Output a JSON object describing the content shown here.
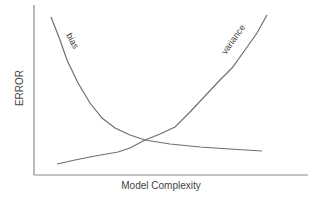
{
  "chart_data": {
    "type": "line",
    "title": "",
    "xlabel": "Model Complexity",
    "ylabel": "ERROR",
    "grid": false,
    "legend": "none (inline curve labels)",
    "series": [
      {
        "name": "bias",
        "label": "bias",
        "description": "decreasing with model complexity",
        "points_px": [
          [
            51,
            17
          ],
          [
            60,
            40
          ],
          [
            67,
            60
          ],
          [
            78,
            83
          ],
          [
            90,
            103
          ],
          [
            102,
            118
          ],
          [
            115,
            128
          ],
          [
            130,
            135
          ],
          [
            145,
            140
          ],
          [
            170,
            144
          ],
          [
            200,
            147
          ],
          [
            230,
            149
          ],
          [
            262,
            151
          ]
        ]
      },
      {
        "name": "variance",
        "label": "variance",
        "description": "increasing with model complexity",
        "points_px": [
          [
            57,
            164
          ],
          [
            75,
            160
          ],
          [
            95,
            156
          ],
          [
            118,
            152
          ],
          [
            130,
            148
          ],
          [
            145,
            140
          ],
          [
            160,
            134
          ],
          [
            175,
            127
          ],
          [
            190,
            112
          ],
          [
            205,
            96
          ],
          [
            220,
            80
          ],
          [
            232,
            68
          ],
          [
            245,
            50
          ],
          [
            257,
            33
          ],
          [
            267,
            15
          ]
        ]
      }
    ],
    "axes": {
      "origin_px": [
        34,
        175
      ],
      "x_end_px": 308,
      "y_top_px": 5
    }
  },
  "labels": {
    "y_axis": "ERROR",
    "x_axis": "Model Complexity",
    "bias": "bias",
    "variance": "variance"
  }
}
